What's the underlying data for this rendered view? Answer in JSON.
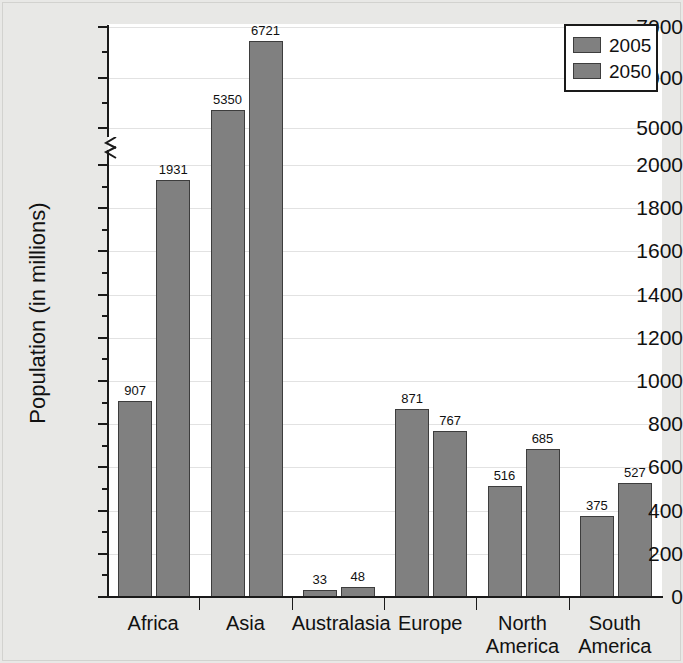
{
  "chart_data": {
    "type": "bar",
    "title": "",
    "xlabel": "",
    "ylabel": "Population (in millions)",
    "categories": [
      "Africa",
      "Asia",
      "Australasia",
      "Europe",
      "North America",
      "South America"
    ],
    "series": [
      {
        "name": "2005",
        "values": [
          907,
          5350,
          33,
          871,
          516,
          375
        ]
      },
      {
        "name": "2050",
        "values": [
          1931,
          6721,
          48,
          767,
          685,
          527
        ]
      }
    ],
    "legend_position": "top-right",
    "grid": true,
    "axis_broken": true,
    "ylim_lower": [
      0,
      2000
    ],
    "ylim_upper": [
      5000,
      7000
    ],
    "y_ticks_lower": [
      0,
      200,
      400,
      600,
      800,
      1000,
      1200,
      1400,
      1600,
      1800,
      2000
    ],
    "y_ticks_upper": [
      5000,
      6000,
      7000
    ],
    "y_minor_step_lower": 100,
    "y_minor_step_upper": 500,
    "colors": {
      "bar_fill": "#808080",
      "bar_border": "#3d3d3d",
      "plot_background": "#ffffff",
      "page_background": "#e8e8e6",
      "axis": "#1a1a1a",
      "gridline": "#e2e2e2",
      "text": "#111111"
    }
  },
  "axis": {
    "y_title": "Population (in millions)",
    "y_tick_labels_upper": [
      "7000",
      "6000",
      "5000"
    ],
    "y_tick_labels_lower": [
      "2000",
      "1800",
      "1600",
      "1400",
      "1200",
      "1000",
      "800",
      "600",
      "400",
      "200",
      "0"
    ]
  },
  "legend": {
    "entries": [
      {
        "label": "2005"
      },
      {
        "label": "2050"
      }
    ]
  },
  "bars": [
    {
      "label": "907",
      "category": "Africa",
      "series": "2005"
    },
    {
      "label": "1931",
      "category": "Africa",
      "series": "2050"
    },
    {
      "label": "5350",
      "category": "Asia",
      "series": "2005"
    },
    {
      "label": "6721",
      "category": "Asia",
      "series": "2050"
    },
    {
      "label": "33",
      "category": "Australasia",
      "series": "2005"
    },
    {
      "label": "48",
      "category": "Australasia",
      "series": "2050"
    },
    {
      "label": "871",
      "category": "Europe",
      "series": "2005"
    },
    {
      "label": "767",
      "category": "Europe",
      "series": "2050"
    },
    {
      "label": "516",
      "category": "North America",
      "series": "2005"
    },
    {
      "label": "685",
      "category": "North America",
      "series": "2050"
    },
    {
      "label": "375",
      "category": "South America",
      "series": "2005"
    },
    {
      "label": "527",
      "category": "South America",
      "series": "2050"
    }
  ],
  "categories": [
    {
      "line1": "Africa",
      "line2": ""
    },
    {
      "line1": "Asia",
      "line2": ""
    },
    {
      "line1": "Australasia",
      "line2": ""
    },
    {
      "line1": "Europe",
      "line2": ""
    },
    {
      "line1": "North",
      "line2": "America"
    },
    {
      "line1": "South",
      "line2": "America"
    }
  ]
}
